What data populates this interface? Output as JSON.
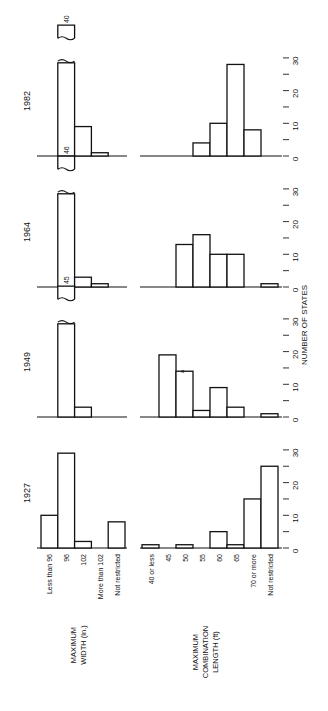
{
  "chart_data": {
    "type": "bar",
    "orientation_note": "Figure is printed rotated 90 degrees counter-clockwise on the page",
    "value_axis_label": "NUMBER OF STATES",
    "value_axis_ticks": [
      0,
      10,
      20,
      30
    ],
    "ylim": [
      0,
      30
    ],
    "grid": false,
    "panel_years": [
      "1982",
      "1964",
      "1949",
      "1927"
    ],
    "width_chart": {
      "title_lines": [
        "MAXIMUM",
        "WIDTH (in.)"
      ],
      "categories": [
        "Less than 96",
        "96",
        "102",
        "More than 102",
        "Not restricted"
      ],
      "series": [
        {
          "name": "1927",
          "values": [
            10,
            29,
            2,
            0,
            8
          ]
        },
        {
          "name": "1949",
          "values": [
            0,
            45,
            3,
            0,
            0
          ],
          "break_labels": {
            "96": "45"
          }
        },
        {
          "name": "1964",
          "values": [
            0,
            46,
            3,
            1,
            0
          ],
          "break_labels": {
            "96": "46"
          }
        },
        {
          "name": "1982",
          "values": [
            0,
            40,
            9,
            1,
            0
          ],
          "break_labels": {
            "96": "40"
          }
        }
      ]
    },
    "length_chart": {
      "title_lines": [
        "MAXIMUM",
        "COMBINATION",
        "LENGTH (ft)"
      ],
      "categories": [
        "40 or less",
        "45",
        "50",
        "55",
        "60",
        "65",
        "70 or more",
        "Not restricted"
      ],
      "series": [
        {
          "name": "1927",
          "values": [
            1,
            0,
            1,
            0,
            5,
            1,
            15,
            25
          ]
        },
        {
          "name": "1949",
          "values": [
            0,
            19,
            14,
            2,
            9,
            3,
            0,
            1
          ],
          "annotations": [
            {
              "category": "50",
              "text": "a"
            }
          ]
        },
        {
          "name": "1964",
          "values": [
            0,
            0,
            13,
            16,
            10,
            10,
            0,
            1
          ]
        },
        {
          "name": "1982",
          "values": [
            0,
            0,
            0,
            4,
            10,
            28,
            8,
            0
          ]
        }
      ]
    }
  }
}
